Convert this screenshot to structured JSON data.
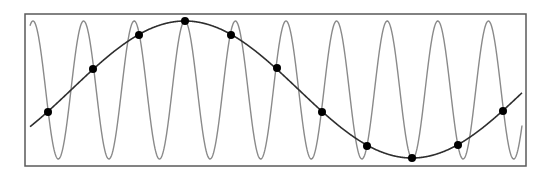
{
  "diagram": {
    "canvas": {
      "width": 555,
      "height": 175
    },
    "frame": {
      "x": 25,
      "y": 14,
      "width": 501,
      "height": 152,
      "stroke": "#5a5a5a",
      "stroke_width": 1.5
    },
    "high_frequency_wave": {
      "label": "sampled-signal",
      "x_start": 30,
      "x_end": 522,
      "center_y": 90,
      "amplitude": 69,
      "period_px": 50.6,
      "peak_x": 33,
      "stroke": "#8a8a8a",
      "stroke_width": 1.4
    },
    "alias_wave": {
      "label": "aliased-signal",
      "x_start": 30,
      "x_end": 522,
      "center_y": 89.5,
      "amplitude": 68.5,
      "period_px": 454,
      "peak_x": 185,
      "stroke": "#2e2e2e",
      "stroke_width": 1.6
    },
    "sample_points": {
      "radius": 4,
      "fill": "#000000",
      "points": [
        {
          "x": 48,
          "y": 112
        },
        {
          "x": 93,
          "y": 69
        },
        {
          "x": 139,
          "y": 35
        },
        {
          "x": 185,
          "y": 21
        },
        {
          "x": 231,
          "y": 35
        },
        {
          "x": 277,
          "y": 68
        },
        {
          "x": 322,
          "y": 112
        },
        {
          "x": 367,
          "y": 146
        },
        {
          "x": 412,
          "y": 158
        },
        {
          "x": 458,
          "y": 145
        },
        {
          "x": 503,
          "y": 111
        }
      ]
    }
  }
}
